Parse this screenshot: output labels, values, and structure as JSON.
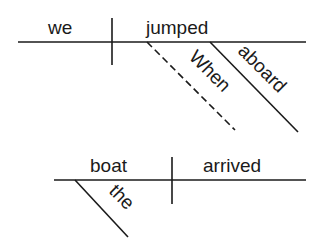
{
  "diagram": {
    "type": "sentence-diagram",
    "clauses": [
      {
        "role": "main-clause",
        "subject": "we",
        "verb": "jumped",
        "modifiers": [
          {
            "word": "aboard",
            "role": "adverb",
            "modifies": "jumped"
          }
        ]
      },
      {
        "role": "subordinate-clause",
        "connector": {
          "word": "When",
          "role": "subordinating-conjunction",
          "style": "dashed"
        },
        "subject": "boat",
        "verb": "arrived",
        "modifiers": [
          {
            "word": "the",
            "role": "article",
            "modifies": "boat"
          }
        ]
      }
    ]
  },
  "labels": {
    "we": "we",
    "jumped": "jumped",
    "when": "When",
    "aboard": "aboard",
    "boat": "boat",
    "arrived": "arrived",
    "the": "the"
  },
  "colors": {
    "ink": "#1a1a1a",
    "background": "#ffffff"
  }
}
